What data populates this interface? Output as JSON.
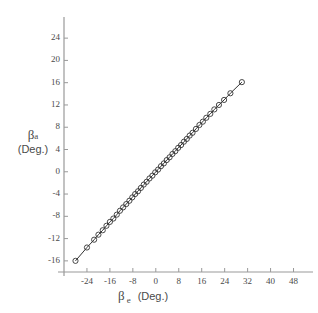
{
  "chart_data": {
    "type": "scatter",
    "title": "",
    "subtitle": "",
    "xlabel": "β e (Deg.)",
    "ylabel": "β a (Deg.)",
    "xlabel_symbol": "β",
    "xlabel_subscript": "e",
    "xlabel_units": "(Deg.)",
    "ylabel_symbol": "β",
    "ylabel_subscript": "a",
    "ylabel_units": "(Deg.)",
    "xlim": [
      -32,
      52
    ],
    "ylim": [
      -18,
      26
    ],
    "xticks": [
      -24,
      -16,
      -8,
      0,
      8,
      16,
      24,
      32,
      40,
      48
    ],
    "yticks": [
      -16,
      -12,
      -8,
      -4,
      0,
      4,
      8,
      12,
      16,
      20,
      24
    ],
    "xticklabels": [
      "-24",
      "-16",
      "-8",
      "0",
      "8",
      "16",
      "24",
      "32",
      "40",
      "48"
    ],
    "yticklabels": [
      "-16",
      "-12",
      "-8",
      "-4",
      "0",
      "4",
      "8",
      "12",
      "16",
      "20",
      "24"
    ],
    "grid": false,
    "legend": "none",
    "marker": "circle-open",
    "line_style": "solid",
    "line_color": "#333333",
    "marker_color": "#333333",
    "axis_color": "#999999",
    "series": [
      {
        "name": "beta_a vs beta_e",
        "x": [
          -28.0,
          -24.0,
          -21.5,
          -20.0,
          -18.5,
          -17.2,
          -16.0,
          -14.8,
          -13.6,
          -12.5,
          -11.4,
          -10.3,
          -9.2,
          -8.2,
          -7.2,
          -6.2,
          -5.2,
          -4.2,
          -3.2,
          -2.2,
          -1.2,
          -0.2,
          0.8,
          1.8,
          2.8,
          3.8,
          4.8,
          5.8,
          6.8,
          7.8,
          8.8,
          9.8,
          10.8,
          11.8,
          12.8,
          14.0,
          15.2,
          16.4,
          17.6,
          19.0,
          20.4,
          22.0,
          23.8,
          26.0,
          30.0
        ],
        "y": [
          -16.0,
          -13.6,
          -12.2,
          -11.3,
          -10.5,
          -9.7,
          -9.0,
          -8.4,
          -7.7,
          -7.0,
          -6.4,
          -5.8,
          -5.2,
          -4.6,
          -4.0,
          -3.5,
          -2.9,
          -2.3,
          -1.8,
          -1.2,
          -0.7,
          -0.1,
          0.4,
          1.0,
          1.5,
          2.1,
          2.6,
          3.2,
          3.7,
          4.3,
          4.8,
          5.4,
          5.9,
          6.5,
          7.0,
          7.7,
          8.4,
          9.0,
          9.7,
          10.4,
          11.2,
          12.0,
          12.9,
          14.1,
          16.1
        ]
      }
    ]
  }
}
